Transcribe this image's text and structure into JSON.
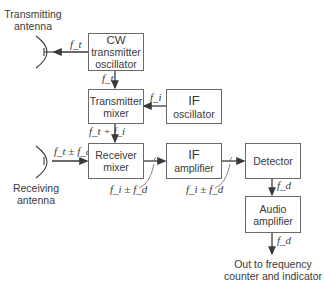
{
  "diagram": {
    "type": "block-diagram",
    "blocks": {
      "cw_oscillator": {
        "line1": "CW",
        "line2": "transmitter",
        "line3": "oscillator"
      },
      "tx_mixer": {
        "line1": "Transmitter",
        "line2": "mixer"
      },
      "if_oscillator": {
        "line1": "IF",
        "line2": "oscillator"
      },
      "rx_mixer": {
        "line1": "Receiver",
        "line2": "mixer"
      },
      "if_amplifier": {
        "line1": "IF",
        "line2": "amplifier"
      },
      "detector": {
        "line1": "Detector"
      },
      "audio_amplifier": {
        "line1": "Audio",
        "line2": "amplifier"
      }
    },
    "antennas": {
      "transmitting": {
        "line1": "Transmitting",
        "line2": "antenna"
      },
      "receiving": {
        "line1": "Receiving",
        "line2": "antenna"
      }
    },
    "signals": {
      "to_tx_antenna": "f_t",
      "osc_to_mixer": "f_t",
      "if_osc_out": "f_i",
      "tx_mixer_out": "f_t + f_i",
      "rx_antenna_in": "f_t ± f_d",
      "rx_mixer_out": "f_i ± f_d",
      "if_amp_out": "f_i ± f_d",
      "detector_out": "f_d",
      "audio_out": "f_d"
    },
    "output": {
      "line1": "Out to frequency",
      "line2": "counter and indicator"
    }
  }
}
